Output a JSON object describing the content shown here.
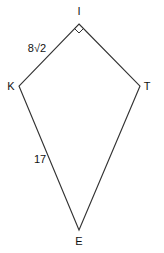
{
  "diagram": {
    "type": "kite",
    "vertices": {
      "I": {
        "label": "I",
        "x": 79,
        "y": 24
      },
      "K": {
        "label": "K",
        "x": 19,
        "y": 86
      },
      "T": {
        "label": "T",
        "x": 140,
        "y": 86
      },
      "E": {
        "label": "E",
        "x": 79,
        "y": 230
      }
    },
    "edges": [
      {
        "from": "I",
        "to": "K",
        "label": "8√2"
      },
      {
        "from": "I",
        "to": "T",
        "label": ""
      },
      {
        "from": "T",
        "to": "E",
        "label": ""
      },
      {
        "from": "E",
        "to": "K",
        "label": "17"
      }
    ],
    "right_angle_at": "I",
    "labels": {
      "I": "I",
      "K": "K",
      "T": "T",
      "E": "E",
      "side_IK": "8√2",
      "side_KE": "17"
    }
  }
}
